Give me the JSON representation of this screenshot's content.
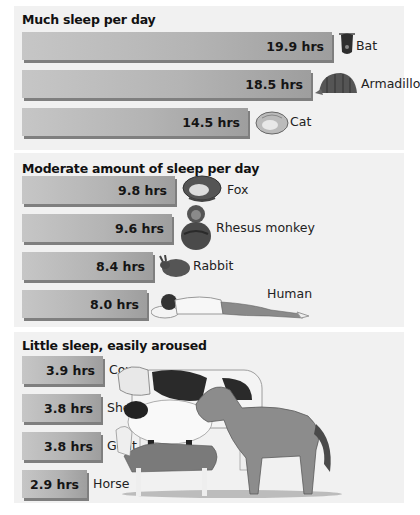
{
  "chart_data": {
    "type": "bar",
    "orientation": "horizontal",
    "unit": "hrs",
    "groups": [
      {
        "title": "Much sleep per day",
        "categories": [
          "Bat",
          "Armadillo",
          "Cat"
        ],
        "values": [
          19.9,
          18.5,
          14.5
        ],
        "labels": [
          "19.9 hrs",
          "18.5 hrs",
          "14.5 hrs"
        ]
      },
      {
        "title": "Moderate amount of sleep per day",
        "categories": [
          "Fox",
          "Rhesus monkey",
          "Rabbit",
          "Human"
        ],
        "values": [
          9.8,
          9.6,
          8.4,
          8.0
        ],
        "labels": [
          "9.8 hrs",
          "9.6 hrs",
          "8.4 hrs",
          "8.0 hrs"
        ]
      },
      {
        "title": "Little sleep, easily aroused",
        "categories": [
          "Cow",
          "Sheep",
          "Goat",
          "Horse"
        ],
        "values": [
          3.9,
          3.8,
          3.8,
          2.9
        ],
        "labels": [
          "3.9 hrs",
          "3.8 hrs",
          "3.8 hrs",
          "2.9 hrs"
        ]
      }
    ],
    "xlabel": "",
    "ylabel": "",
    "grid": false,
    "legend": "none"
  },
  "icons": {
    "Bat": "bat-icon",
    "Armadillo": "armadillo-icon",
    "Cat": "cat-icon",
    "Fox": "fox-icon",
    "Rhesus monkey": "monkey-icon",
    "Rabbit": "rabbit-icon",
    "Human": "sleeping-human-icon",
    "farm": "farm-animals-illustration"
  },
  "colors": {
    "panel": "#f1f1f1",
    "bar_light": "#c6c6c6",
    "bar_dark": "#9e9e9e",
    "bar_shadow": "#7f7f7f"
  }
}
